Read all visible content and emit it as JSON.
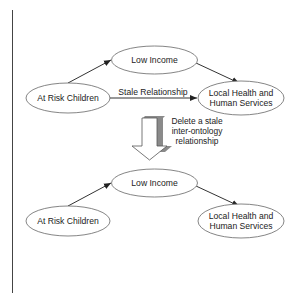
{
  "diagram": {
    "before": {
      "nodes": {
        "at_risk": "At Risk Children",
        "low_income": "Low Income",
        "lhhs_line1": "Local Health and",
        "lhhs_line2": "Human Services"
      },
      "edges": [
        {
          "from": "At Risk Children",
          "to": "Low Income"
        },
        {
          "from": "Low Income",
          "to": "Local Health and Human Services"
        },
        {
          "from": "At Risk Children",
          "to": "Local Health and Human Services",
          "label": "Stale Relationship"
        }
      ],
      "stale_label": "Stale Relationship"
    },
    "transition": {
      "line1": "Delete a stale",
      "line2": "inter-ontology",
      "line3": "relationship"
    },
    "after": {
      "nodes": {
        "at_risk": "At Risk Children",
        "low_income": "Low Income",
        "lhhs_line1": "Local Health and",
        "lhhs_line2": "Human Services"
      },
      "edges": [
        {
          "from": "At Risk Children",
          "to": "Low Income"
        },
        {
          "from": "Low Income",
          "to": "Local Health and Human Services"
        }
      ]
    },
    "colors": {
      "stroke": "#555555",
      "edge": "#333333",
      "arrow_fill": "#ffffff",
      "arrow_shade": "#8a8a8a"
    }
  }
}
